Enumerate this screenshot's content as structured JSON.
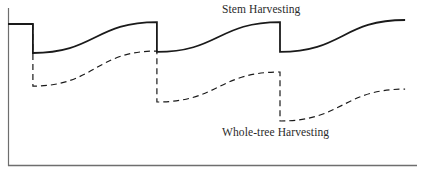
{
  "chart_data": {
    "type": "line",
    "title": "",
    "xlabel": "",
    "ylabel": "",
    "x_range": [
      0,
      100
    ],
    "ylim": [
      0,
      100
    ],
    "grid": false,
    "legend_position": "inline-labels",
    "annotations": [
      {
        "text": "Stem Harvesting",
        "target_series": "Stem Harvesting",
        "position": "above solid curve, right-center"
      },
      {
        "text": "Whole-tree Harvesting",
        "target_series": "Whole-tree Harvesting",
        "position": "below dashed curve, right-center"
      }
    ],
    "harvest_events_x": [
      6.1,
      36.4,
      66.5
    ],
    "series": [
      {
        "name": "Stem Harvesting",
        "style": "solid",
        "color": "#1a1a1a",
        "points": [
          [
            0,
            89.9
          ],
          [
            6.1,
            89.9
          ],
          [
            6.1,
            71.5
          ],
          [
            21.3,
            81.3
          ],
          [
            36.4,
            91.1
          ],
          [
            36.4,
            72.2
          ],
          [
            51.5,
            81.6
          ],
          [
            66.5,
            91.1
          ],
          [
            66.5,
            72.2
          ],
          [
            81.5,
            82.3
          ],
          [
            97.1,
            92.4
          ]
        ]
      },
      {
        "name": "Whole-tree Harvesting",
        "style": "dashed",
        "color": "#1a1a1a",
        "points": [
          [
            0,
            89.9
          ],
          [
            6.1,
            89.9
          ],
          [
            6.1,
            50.6
          ],
          [
            21.3,
            61.7
          ],
          [
            36.4,
            72.8
          ],
          [
            36.4,
            40.5
          ],
          [
            51.5,
            50.0
          ],
          [
            66.5,
            59.5
          ],
          [
            66.5,
            28.5
          ],
          [
            81.5,
            38.6
          ],
          [
            97.1,
            48.7
          ]
        ]
      }
    ]
  },
  "labels": {
    "stem": "Stem Harvesting",
    "whole_tree": "Whole-tree Harvesting"
  },
  "colors": {
    "line": "#1a1a1a",
    "axis": "#6e6e6e",
    "background": "#ffffff"
  }
}
